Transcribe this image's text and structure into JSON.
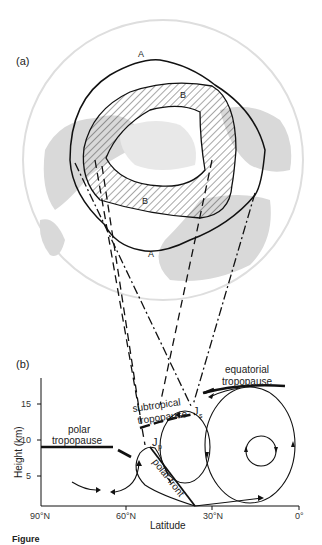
{
  "panel_a": {
    "label": "(a)",
    "region_labels": {
      "outer_top": "A",
      "outer_bottom": "A",
      "inner_top": "B",
      "inner_bottom": "B"
    }
  },
  "panel_b": {
    "label": "(b)",
    "y_axis": {
      "title": "Height (km)",
      "ticks": [
        "5",
        "10",
        "15"
      ]
    },
    "x_axis": {
      "title": "Latitude",
      "ticks": [
        "90°N",
        "60°N",
        "30°N",
        "0°"
      ]
    },
    "annotations": {
      "polar_tropopause_1": "polar",
      "polar_tropopause_2": "tropopause",
      "subtropical_1": "subtropical",
      "subtropical_2": "tropopause",
      "equatorial_1": "equatorial",
      "equatorial_2": "tropopause",
      "polar_front": "polar front",
      "jet_polar": "J",
      "jet_polar_sub": "p",
      "jet_subtropical": "J",
      "jet_subtropical_sub": "s"
    }
  },
  "caption": {
    "prefix": "Figure"
  },
  "colors": {
    "ink": "#111111",
    "map_land": "#d9d9d9",
    "map_circle": "#dedede"
  }
}
